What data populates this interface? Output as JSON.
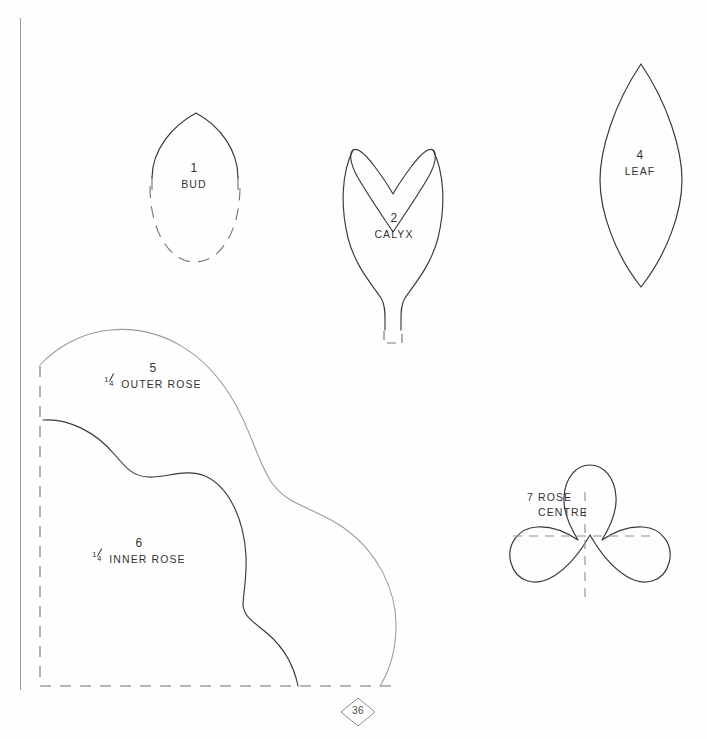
{
  "page": {
    "kind": "sewing-pattern-template-sheet",
    "page_number": "36",
    "background_color": "#fefefe",
    "ink_color": "#2b2b2b",
    "faint_ink_color": "#8a8a8a"
  },
  "pieces": [
    {
      "id": "bud",
      "number": "1",
      "name": "BUD",
      "label_x": 194,
      "label_y": 168
    },
    {
      "id": "calyx",
      "number": "2",
      "name": "CALYX",
      "label_x": 394,
      "label_y": 218
    },
    {
      "id": "leaf",
      "number": "4",
      "name": "LEAF",
      "label_x": 640,
      "label_y": 155
    },
    {
      "id": "outer-rose",
      "number": "5",
      "fraction": "1/4",
      "name": "OUTER ROSE",
      "full_name": "1/4 OUTER ROSE",
      "label_x": 153,
      "label_y": 368
    },
    {
      "id": "inner-rose",
      "number": "6",
      "fraction": "1/4",
      "name": "INNER ROSE",
      "full_name": "1/4 INNER ROSE",
      "label_x": 139,
      "label_y": 543
    },
    {
      "id": "rose-centre",
      "number": "7",
      "name": "ROSE CENTRE",
      "line1": "7 ROSE",
      "line2": "CENTRE",
      "label_x": 527,
      "label_y": 492
    }
  ],
  "fraction_glyph": {
    "numerator": "1",
    "denominator": "4"
  }
}
